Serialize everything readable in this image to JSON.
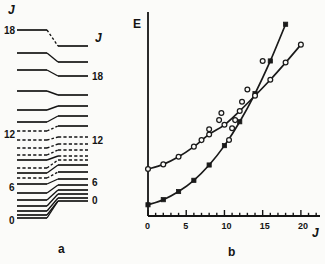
{
  "figure": {
    "panels": [
      {
        "id": "a",
        "caption": "a",
        "type": "level-correlation-diagram"
      },
      {
        "id": "b",
        "caption": "b",
        "type": "line-plot"
      }
    ]
  },
  "panel_a": {
    "caption": "a",
    "left_column": {
      "header": "J",
      "header_x": 8,
      "header_y": 4,
      "labels": [
        {
          "text": "18",
          "x": 4,
          "y": 26
        },
        {
          "text": "12",
          "x": 4,
          "y": 130
        },
        {
          "text": "6",
          "x": 9,
          "y": 183
        },
        {
          "text": "0",
          "x": 9,
          "y": 216
        }
      ],
      "solid_levels": [
        {
          "y": 30,
          "x1": 17,
          "x2": 47
        },
        {
          "y": 53,
          "x1": 17,
          "x2": 47
        },
        {
          "y": 70,
          "x1": 17,
          "x2": 47
        },
        {
          "y": 91,
          "x1": 17,
          "x2": 47
        },
        {
          "y": 110,
          "x1": 17,
          "x2": 47
        },
        {
          "y": 122,
          "x1": 17,
          "x2": 47
        },
        {
          "y": 160,
          "x1": 17,
          "x2": 47
        },
        {
          "y": 173,
          "x1": 17,
          "x2": 47
        },
        {
          "y": 184,
          "x1": 17,
          "x2": 47
        },
        {
          "y": 193,
          "x1": 17,
          "x2": 47
        },
        {
          "y": 200,
          "x1": 17,
          "x2": 47
        },
        {
          "y": 206,
          "x1": 17,
          "x2": 47
        },
        {
          "y": 211,
          "x1": 17,
          "x2": 47
        },
        {
          "y": 215,
          "x1": 17,
          "x2": 47
        },
        {
          "y": 218,
          "x1": 17,
          "x2": 47
        }
      ],
      "dashed_levels": [
        {
          "y": 131,
          "x1": 17,
          "x2": 47
        },
        {
          "y": 140,
          "x1": 17,
          "x2": 47
        },
        {
          "y": 148,
          "x1": 17,
          "x2": 47
        },
        {
          "y": 155,
          "x1": 17,
          "x2": 47
        },
        {
          "y": 168,
          "x1": 17,
          "x2": 47
        },
        {
          "y": 178,
          "x1": 17,
          "x2": 47
        }
      ]
    },
    "right_column": {
      "header": "J",
      "header_x": 95,
      "header_y": 32,
      "labels": [
        {
          "text": "18",
          "x": 92,
          "y": 72
        },
        {
          "text": "12",
          "x": 92,
          "y": 136
        },
        {
          "text": "6",
          "x": 92,
          "y": 178
        },
        {
          "text": "0",
          "x": 92,
          "y": 196
        }
      ],
      "solid_levels": [
        {
          "y": 46,
          "x1": 58,
          "x2": 88
        },
        {
          "y": 62,
          "x1": 58,
          "x2": 88
        },
        {
          "y": 76,
          "x1": 58,
          "x2": 88
        },
        {
          "y": 95,
          "x1": 58,
          "x2": 88
        },
        {
          "y": 106,
          "x1": 58,
          "x2": 88
        },
        {
          "y": 116,
          "x1": 58,
          "x2": 88
        },
        {
          "y": 126,
          "x1": 58,
          "x2": 88
        },
        {
          "y": 165,
          "x1": 58,
          "x2": 88
        },
        {
          "y": 172,
          "x1": 58,
          "x2": 88
        },
        {
          "y": 179,
          "x1": 58,
          "x2": 88
        },
        {
          "y": 185,
          "x1": 58,
          "x2": 88
        },
        {
          "y": 190,
          "x1": 58,
          "x2": 88
        },
        {
          "y": 194,
          "x1": 58,
          "x2": 88
        },
        {
          "y": 198,
          "x1": 58,
          "x2": 88
        },
        {
          "y": 201,
          "x1": 58,
          "x2": 88
        }
      ],
      "dashed_levels": [
        {
          "y": 137,
          "x1": 58,
          "x2": 88
        },
        {
          "y": 144,
          "x1": 58,
          "x2": 88
        },
        {
          "y": 150,
          "x1": 58,
          "x2": 88
        },
        {
          "y": 156,
          "x1": 58,
          "x2": 88
        },
        {
          "y": 160,
          "x1": 58,
          "x2": 88
        }
      ]
    },
    "connectors": [
      {
        "x1": 47,
        "y1": 30,
        "x2": 58,
        "y2": 46,
        "style": "dashed"
      },
      {
        "x1": 47,
        "y1": 53,
        "x2": 58,
        "y2": 62,
        "style": "solid"
      },
      {
        "x1": 47,
        "y1": 70,
        "x2": 58,
        "y2": 76,
        "style": "solid"
      },
      {
        "x1": 47,
        "y1": 91,
        "x2": 58,
        "y2": 95,
        "style": "solid"
      },
      {
        "x1": 47,
        "y1": 110,
        "x2": 58,
        "y2": 106,
        "style": "solid"
      },
      {
        "x1": 47,
        "y1": 122,
        "x2": 58,
        "y2": 116,
        "style": "solid"
      },
      {
        "x1": 47,
        "y1": 131,
        "x2": 58,
        "y2": 126,
        "style": "dashed"
      },
      {
        "x1": 47,
        "y1": 140,
        "x2": 58,
        "y2": 137,
        "style": "dashed"
      },
      {
        "x1": 47,
        "y1": 148,
        "x2": 58,
        "y2": 144,
        "style": "dashed"
      },
      {
        "x1": 47,
        "y1": 155,
        "x2": 58,
        "y2": 150,
        "style": "dashed"
      },
      {
        "x1": 47,
        "y1": 160,
        "x2": 58,
        "y2": 156,
        "style": "solid"
      },
      {
        "x1": 47,
        "y1": 168,
        "x2": 58,
        "y2": 160,
        "style": "dashed"
      },
      {
        "x1": 47,
        "y1": 173,
        "x2": 58,
        "y2": 165,
        "style": "solid"
      },
      {
        "x1": 47,
        "y1": 178,
        "x2": 58,
        "y2": 172,
        "style": "dashed"
      },
      {
        "x1": 47,
        "y1": 184,
        "x2": 58,
        "y2": 179,
        "style": "solid"
      },
      {
        "x1": 47,
        "y1": 193,
        "x2": 58,
        "y2": 185,
        "style": "solid"
      },
      {
        "x1": 47,
        "y1": 200,
        "x2": 58,
        "y2": 190,
        "style": "solid"
      },
      {
        "x1": 47,
        "y1": 206,
        "x2": 58,
        "y2": 194,
        "style": "solid"
      },
      {
        "x1": 47,
        "y1": 211,
        "x2": 58,
        "y2": 198,
        "style": "solid"
      },
      {
        "x1": 47,
        "y1": 215,
        "x2": 58,
        "y2": 201,
        "style": "solid"
      },
      {
        "x1": 47,
        "y1": 218,
        "x2": 58,
        "y2": 201,
        "style": "solid"
      }
    ]
  },
  "chart_data": {
    "type": "line",
    "title": "",
    "caption": "b",
    "xlabel": "J",
    "ylabel": "E",
    "xlim": [
      0,
      22.5
    ],
    "ylim": [
      0,
      1
    ],
    "grid": false,
    "legend": "none",
    "x_major_ticks": [
      0,
      5,
      10,
      15,
      20
    ],
    "x_major_tick_labels": [
      "0",
      "5",
      "10",
      "15",
      "20"
    ],
    "x_minor_tick_step": 1,
    "y_axis_ticks": false,
    "series": [
      {
        "name": "ground-band",
        "marker": "filled-square",
        "marker_color": "#1a1a1a",
        "line_color": "#1a1a1a",
        "x": [
          0,
          2,
          4,
          6,
          8,
          10,
          12,
          14,
          16,
          18
        ],
        "y": [
          0.055,
          0.08,
          0.12,
          0.175,
          0.25,
          0.345,
          0.462,
          0.6,
          0.76,
          0.94
        ]
      },
      {
        "name": "excited-band",
        "marker": "open-circle",
        "marker_color": "#1a1a1a",
        "line_color": "#1a1a1a",
        "x": [
          0,
          2,
          4,
          6,
          8,
          10,
          12,
          14,
          16,
          18,
          20
        ],
        "y": [
          0.23,
          0.253,
          0.29,
          0.34,
          0.4,
          0.447,
          0.515,
          0.59,
          0.668,
          0.752,
          0.84
        ]
      }
    ],
    "scatter_points": [
      {
        "series": "excited-band",
        "x": 7.0,
        "y": 0.372
      },
      {
        "series": "excited-band",
        "x": 8.0,
        "y": 0.425
      },
      {
        "series": "excited-band",
        "x": 9.3,
        "y": 0.47
      },
      {
        "series": "excited-band",
        "x": 9.6,
        "y": 0.505
      },
      {
        "series": "excited-band",
        "x": 10.6,
        "y": 0.373
      },
      {
        "series": "excited-band",
        "x": 11.0,
        "y": 0.43
      },
      {
        "series": "excited-band",
        "x": 11.4,
        "y": 0.47
      },
      {
        "series": "excited-band",
        "x": 12.3,
        "y": 0.56
      },
      {
        "series": "excited-band",
        "x": 13.0,
        "y": 0.62
      },
      {
        "series": "excited-band",
        "x": 15.0,
        "y": 0.76
      }
    ]
  }
}
